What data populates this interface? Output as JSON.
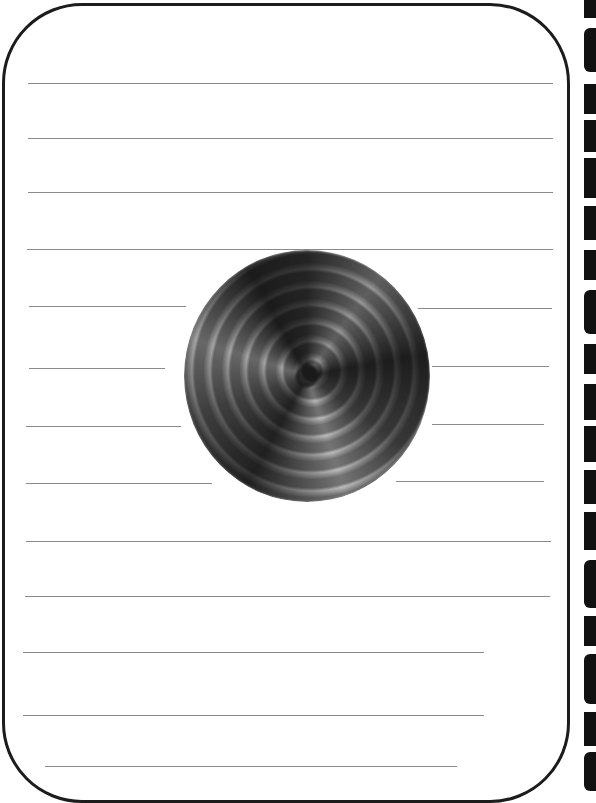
{
  "page": {
    "type": "lined-writing-paper",
    "border_color": "#1c1c1c",
    "line_color": "#8a8a8a",
    "background": "#ffffff"
  },
  "lines": [
    {
      "x1": 28,
      "x2": 553,
      "y": 83
    },
    {
      "x1": 28,
      "x2": 553,
      "y": 138
    },
    {
      "x1": 28,
      "x2": 553,
      "y": 192
    },
    {
      "x1": 27,
      "x2": 553,
      "y": 249
    },
    {
      "x1": 29,
      "x2": 186,
      "y": 306
    },
    {
      "x1": 418,
      "x2": 552,
      "y": 308
    },
    {
      "x1": 29,
      "x2": 165,
      "y": 368
    },
    {
      "x1": 432,
      "x2": 549,
      "y": 366
    },
    {
      "x1": 26,
      "x2": 181,
      "y": 426
    },
    {
      "x1": 432,
      "x2": 544,
      "y": 424
    },
    {
      "x1": 26,
      "x2": 212,
      "y": 483
    },
    {
      "x1": 396,
      "x2": 544,
      "y": 481
    },
    {
      "x1": 26,
      "x2": 551,
      "y": 541
    },
    {
      "x1": 25,
      "x2": 550,
      "y": 596
    },
    {
      "x1": 23,
      "x2": 484,
      "y": 652
    },
    {
      "x1": 23,
      "x2": 484,
      "y": 715
    },
    {
      "x1": 45,
      "x2": 457,
      "y": 766
    }
  ],
  "image": {
    "name": "swirl-spiral",
    "description": "dark grayscale spiral vortex",
    "center_x": 307,
    "center_y": 376,
    "diameter": 248
  },
  "edge_marks": [
    {
      "top": 0,
      "height": 18,
      "round": false
    },
    {
      "top": 28,
      "height": 44,
      "round": true
    },
    {
      "top": 84,
      "height": 30,
      "round": false
    },
    {
      "top": 120,
      "height": 32,
      "round": false
    },
    {
      "top": 158,
      "height": 40,
      "round": false
    },
    {
      "top": 206,
      "height": 34,
      "round": false
    },
    {
      "top": 250,
      "height": 30,
      "round": false
    },
    {
      "top": 290,
      "height": 44,
      "round": true
    },
    {
      "top": 344,
      "height": 30,
      "round": false
    },
    {
      "top": 384,
      "height": 36,
      "round": false
    },
    {
      "top": 426,
      "height": 36,
      "round": false
    },
    {
      "top": 470,
      "height": 34,
      "round": false
    },
    {
      "top": 512,
      "height": 38,
      "round": false
    },
    {
      "top": 560,
      "height": 48,
      "round": true
    },
    {
      "top": 616,
      "height": 30,
      "round": false
    },
    {
      "top": 654,
      "height": 50,
      "round": true
    },
    {
      "top": 712,
      "height": 34,
      "round": false
    },
    {
      "top": 752,
      "height": 39,
      "round": true
    }
  ]
}
